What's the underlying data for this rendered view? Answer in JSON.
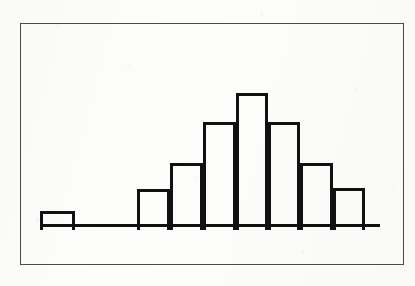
{
  "figure": {
    "kind": "scanned-figure",
    "frame": {
      "x": 20,
      "y": 23,
      "width": 384,
      "height": 242,
      "border_color": "#4a4a4a"
    },
    "background_color": "#fdfdfc",
    "ink_color": "#111111",
    "baseline": {
      "x_start": 40,
      "x_end": 380,
      "y": 227,
      "thickness": 3
    }
  },
  "chart_data": {
    "type": "bar",
    "title": "",
    "subtitle": "",
    "xlabel": "",
    "ylabel": "",
    "grid": false,
    "legend": null,
    "axis_line_visible": true,
    "y_axis_visible": false,
    "tick_labels_visible": false,
    "categories": [
      "1",
      "2",
      "3",
      "4",
      "5",
      "6",
      "7",
      "8",
      "9",
      "10"
    ],
    "values": [
      1,
      0,
      0,
      2,
      4,
      6.5,
      8,
      6.5,
      4,
      2
    ],
    "values_pixel_heights": [
      16,
      0,
      0,
      38,
      64,
      105,
      134,
      105,
      64,
      39
    ],
    "ylim": [
      0,
      9
    ],
    "annotations": [
      "Isolated low bar at the far left, separated from the main cluster by an empty gap",
      "Main cluster of seven adjacent bars forms a symmetric bell / mound shape",
      "Unimodal distribution with a single peak and one outlier group on the left"
    ],
    "bars": [
      {
        "name": "bar-outlier-left",
        "x": 40,
        "y": 211,
        "width": 35,
        "height": 16,
        "value": 1,
        "adjacent": false
      },
      {
        "name": "bar-1",
        "x": 137,
        "y": 189,
        "width": 33,
        "height": 38,
        "value": 2,
        "adjacent": true
      },
      {
        "name": "bar-2",
        "x": 170,
        "y": 163,
        "width": 33,
        "height": 64,
        "value": 4,
        "adjacent": true
      },
      {
        "name": "bar-3",
        "x": 203,
        "y": 122,
        "width": 33,
        "height": 105,
        "value": 6.5,
        "adjacent": true
      },
      {
        "name": "bar-4-peak",
        "x": 236,
        "y": 93,
        "width": 32,
        "height": 134,
        "value": 8,
        "adjacent": true
      },
      {
        "name": "bar-5",
        "x": 268,
        "y": 122,
        "width": 32,
        "height": 105,
        "value": 6.5,
        "adjacent": true
      },
      {
        "name": "bar-6",
        "x": 300,
        "y": 163,
        "width": 33,
        "height": 64,
        "value": 4,
        "adjacent": true
      },
      {
        "name": "bar-7",
        "x": 333,
        "y": 188,
        "width": 32,
        "height": 39,
        "value": 2,
        "adjacent": true
      }
    ]
  }
}
